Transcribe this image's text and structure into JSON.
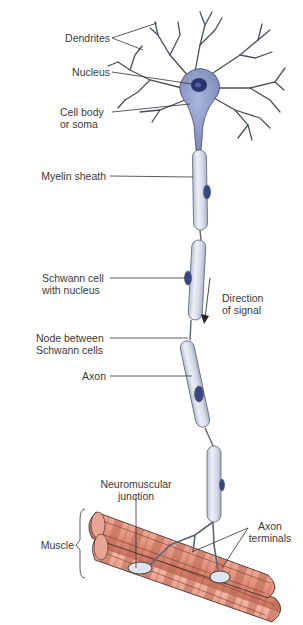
{
  "diagram": {
    "labels": {
      "dendrites": "Dendrites",
      "nucleus": "Nucleus",
      "cell_body_1": "Cell body",
      "cell_body_2": "or soma",
      "myelin_sheath": "Myelin sheath",
      "schwann_cell_1": "Schwann cell",
      "schwann_cell_2": "with nucleus",
      "direction_1": "Direction",
      "direction_2": "of signal",
      "node_1": "Node between",
      "node_2": "Schwann cells",
      "axon": "Axon",
      "nmj_1": "Neuromuscular",
      "nmj_2": "junction",
      "axon_terminals_1": "Axon",
      "axon_terminals_2": "terminals",
      "muscle": "Muscle"
    },
    "colors": {
      "soma": "#8f9ec8",
      "soma_nucleus": "#2a3570",
      "myelin": "#dfe3f0",
      "myelin_outline": "#5d6478",
      "schwann_nucleus": "#3a4584",
      "dendrite": "#4a4f5e",
      "muscle": "#e49a86",
      "muscle_dark": "#b0604e",
      "leader_line": "#333333"
    }
  }
}
